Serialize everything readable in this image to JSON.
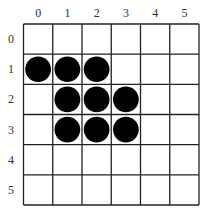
{
  "board": {
    "columns": [
      "0",
      "1",
      "2",
      "3",
      "4",
      "5"
    ],
    "rows": [
      "0",
      "1",
      "2",
      "3",
      "4",
      "5"
    ],
    "stones": [
      {
        "row": 1,
        "col": 0
      },
      {
        "row": 1,
        "col": 1
      },
      {
        "row": 1,
        "col": 2
      },
      {
        "row": 2,
        "col": 1
      },
      {
        "row": 2,
        "col": 2
      },
      {
        "row": 2,
        "col": 3
      },
      {
        "row": 3,
        "col": 1
      },
      {
        "row": 3,
        "col": 2
      },
      {
        "row": 3,
        "col": 3
      }
    ],
    "stone_color": "#000000",
    "line_color": "#222222"
  }
}
